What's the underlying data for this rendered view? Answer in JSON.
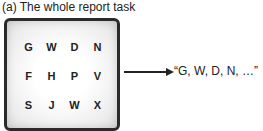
{
  "caption": "(a) The whole report task",
  "grid": {
    "rows": [
      [
        "G",
        "W",
        "D",
        "N"
      ],
      [
        "F",
        "H",
        "P",
        "V"
      ],
      [
        "S",
        "J",
        "W",
        "X"
      ]
    ]
  },
  "report": "“G, W, D, N, …”"
}
